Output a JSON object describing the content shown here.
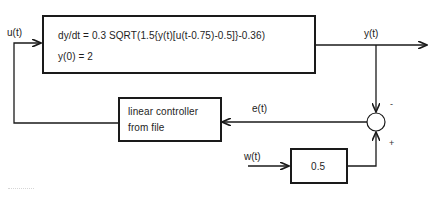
{
  "diagram": {
    "type": "block-diagram",
    "plant": {
      "equation": "dy/dt = 0.3 SQRT(1.5{y(t)[u(t-0.75)-0.5]}-0.36)",
      "initial_condition": "y(0) = 2"
    },
    "controller": {
      "line1": "linear controller",
      "line2": "from file"
    },
    "gain": {
      "value": "0.5"
    },
    "signals": {
      "input": "u(t)",
      "output": "y(t)",
      "error": "e(t)",
      "reference": "w(t)"
    },
    "summing_junction": {
      "top_sign": "-",
      "bottom_sign": "+"
    },
    "colors": {
      "line": "#1a1a1a",
      "background": "#ffffff"
    }
  }
}
